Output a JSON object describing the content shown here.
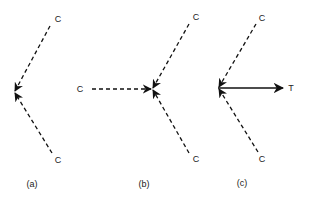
{
  "diagram": {
    "panels": [
      {
        "caption": "(a)",
        "vertex": {
          "x": 14,
          "y": 92
        },
        "arrows": [
          {
            "from_label": "C",
            "style": "dashed",
            "direction": "into-vertex",
            "from": {
              "x": 50,
              "y": 26
            }
          },
          {
            "from_label": "C",
            "style": "dashed",
            "direction": "into-vertex",
            "from": {
              "x": 52,
              "y": 153
            }
          }
        ]
      },
      {
        "caption": "(b)",
        "vertex": {
          "x": 152,
          "y": 89
        },
        "arrows": [
          {
            "from_label": "C",
            "style": "dashed",
            "direction": "into-vertex",
            "from": {
              "x": 92,
              "y": 89
            }
          },
          {
            "from_label": "C",
            "style": "dashed",
            "direction": "into-vertex",
            "from": {
              "x": 189,
              "y": 24
            }
          },
          {
            "from_label": "C",
            "style": "dashed",
            "direction": "into-vertex",
            "from": {
              "x": 189,
              "y": 153
            }
          }
        ]
      },
      {
        "caption": "(c)",
        "vertex": {
          "x": 218,
          "y": 88
        },
        "arrows": [
          {
            "from_label": "C",
            "style": "dashed",
            "direction": "into-vertex",
            "from": {
              "x": 256,
              "y": 24
            }
          },
          {
            "from_label": "C",
            "style": "dashed",
            "direction": "into-vertex",
            "from": {
              "x": 258,
              "y": 152
            }
          },
          {
            "to_label": "T",
            "style": "solid",
            "direction": "out-of-vertex",
            "to": {
              "x": 282,
              "y": 88
            }
          }
        ]
      }
    ],
    "labels": {
      "a_top_c": "C",
      "a_bottom_c": "C",
      "b_left_c": "C",
      "b_top_c": "C",
      "b_bottom_c": "C",
      "c_top_c": "C",
      "c_bottom_c": "C",
      "c_t": "T",
      "caption_a": "(a)",
      "caption_b": "(b)",
      "caption_c": "(c)"
    },
    "colors": {
      "stroke": "#111111",
      "background": "#ffffff"
    }
  }
}
